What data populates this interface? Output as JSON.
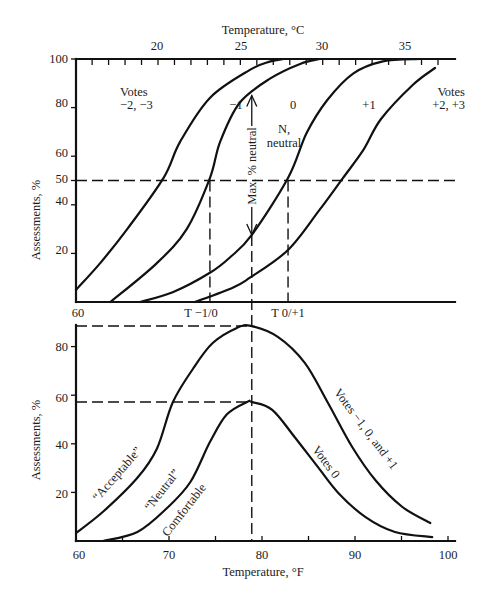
{
  "figure": {
    "top_axis": {
      "title": "Temperature, °C",
      "tick_labels": [
        "20",
        "25",
        "30",
        "35"
      ]
    },
    "bottom_axis": {
      "title": "Temperature, °F",
      "tick_labels": [
        "60",
        "70",
        "80",
        "90",
        "100"
      ]
    },
    "upper_panel": {
      "ylabel": "Assessments, %",
      "ytick_labels": [
        "100",
        "80",
        "60",
        "50",
        "40",
        "20"
      ],
      "x_start_label": "60",
      "t_minus1_0_label": "T −1/0",
      "t_0_plus1_label": "T 0/+1",
      "zone_labels": {
        "votes_neg": [
          "Votes",
          "−2, −3"
        ],
        "minus1": "−1",
        "zero": "0",
        "plus1": "+1",
        "votes_pos": [
          "Votes",
          "+2, +3"
        ],
        "neutral": [
          "N,",
          "neutral"
        ]
      },
      "max_label": "Max. % neutral"
    },
    "lower_panel": {
      "ylabel": "Assessments, %",
      "ytick_labels": [
        "80",
        "60",
        "40",
        "20"
      ],
      "curve_labels": {
        "acceptable": "“Acceptable”",
        "neutral": "“Neutral”",
        "comfortable": "Comfortable",
        "votes0": "Votes 0",
        "votes_m1_0_p1": "Votes −1, 0, and +1"
      }
    },
    "colors": {
      "ink": "#111111",
      "background": "#ffffff"
    }
  },
  "chart_data": [
    {
      "type": "line",
      "panel": "upper",
      "title": "",
      "xlabel": "Temperature, °F",
      "x2label": "Temperature, °C",
      "ylabel": "Assessments, %",
      "xlim": [
        60,
        101
      ],
      "x2_ticks": [
        20,
        25,
        30,
        35
      ],
      "x2_minor_tick_range": [
        16,
        37
      ],
      "ylim": [
        0,
        100
      ],
      "yticks": [
        20,
        40,
        50,
        60,
        80,
        100
      ],
      "grid": false,
      "legend": "none (inline zone labels)",
      "zones": [
        "Votes −2, −3",
        "−1",
        "0",
        "+1",
        "Votes +2, +3"
      ],
      "series": [
        {
          "name": "Boundary: votes −2,−3 | −1",
          "points": [
            [
              60,
              5
            ],
            [
              62.6,
              16
            ],
            [
              65.5,
              30
            ],
            [
              69.4,
              51
            ],
            [
              71.2,
              66
            ],
            [
              74.4,
              84
            ],
            [
              78.7,
              95.5
            ],
            [
              80.9,
              99
            ],
            [
              82.3,
              100
            ]
          ]
        },
        {
          "name": "Boundary: votes −1 | 0",
          "points": [
            [
              63.7,
              0
            ],
            [
              68.7,
              16
            ],
            [
              71.9,
              30
            ],
            [
              74.4,
              51
            ],
            [
              75.5,
              66
            ],
            [
              77.6,
              82
            ],
            [
              80.9,
              92
            ],
            [
              84.1,
              98
            ],
            [
              86.2,
              100
            ]
          ]
        },
        {
          "name": "Boundary: votes 0 | +1",
          "points": [
            [
              66.9,
              0
            ],
            [
              70.4,
              4
            ],
            [
              74.4,
              12
            ],
            [
              76.6,
              18.5
            ],
            [
              78.9,
              27.6
            ],
            [
              82.8,
              51
            ],
            [
              84.8,
              69.5
            ],
            [
              87,
              83
            ],
            [
              89.8,
              94
            ],
            [
              93,
              99
            ],
            [
              97,
              100
            ]
          ]
        },
        {
          "name": "Boundary: votes +1 | +2,+3",
          "points": [
            [
              72.8,
              0
            ],
            [
              76.9,
              6
            ],
            [
              78.7,
              10
            ],
            [
              82.8,
              21.4
            ],
            [
              86.2,
              38
            ],
            [
              88.7,
              51
            ],
            [
              90.9,
              62.6
            ],
            [
              92.8,
              75.3
            ],
            [
              96.2,
              89.3
            ],
            [
              98.6,
              96.3
            ]
          ]
        }
      ],
      "reference_lines": [
        {
          "orientation": "h",
          "value": 50
        },
        {
          "orientation": "v",
          "value": 74.4,
          "label": "T −1/0"
        },
        {
          "orientation": "v",
          "value": 82.8,
          "label": "T 0/+1"
        }
      ],
      "annotations": [
        {
          "type": "double-arrow",
          "text": "Max. % neutral",
          "x": 78.9,
          "y_from": 85,
          "y_to": 27.6
        },
        {
          "type": "text",
          "text": "N, neutral",
          "zone": "0"
        }
      ]
    },
    {
      "type": "line",
      "panel": "lower",
      "title": "",
      "xlabel": "Temperature, °F",
      "ylabel": "Assessments, %",
      "xlim": [
        60,
        101
      ],
      "xticks": [
        60,
        70,
        80,
        90,
        100
      ],
      "x_minor_step": 5,
      "ylim": [
        0,
        89
      ],
      "yticks": [
        20,
        40,
        60,
        80
      ],
      "grid": false,
      "series": [
        {
          "name": "“Acceptable” (Votes −1, 0, and +1)",
          "points": [
            [
              60,
              3.3
            ],
            [
              62.9,
              12
            ],
            [
              66.6,
              26
            ],
            [
              68.7,
              38
            ],
            [
              70.4,
              57
            ],
            [
              72.6,
              71
            ],
            [
              74.7,
              81.5
            ],
            [
              77.3,
              87.7
            ],
            [
              78.8,
              88.5
            ],
            [
              81.7,
              84
            ],
            [
              84.6,
              73.3
            ],
            [
              87.1,
              56.8
            ],
            [
              89.7,
              38.7
            ],
            [
              92.2,
              25
            ],
            [
              95.1,
              14
            ],
            [
              98.1,
              7.4
            ]
          ]
        },
        {
          "name": "“Neutral” Comfortable (Votes 0)",
          "points": [
            [
              62.9,
              0
            ],
            [
              66.6,
              3.7
            ],
            [
              69.8,
              13.6
            ],
            [
              72.3,
              24.3
            ],
            [
              74.4,
              40.7
            ],
            [
              76.2,
              52
            ],
            [
              78.4,
              57.2
            ],
            [
              78.9,
              57.2
            ],
            [
              81.1,
              54
            ],
            [
              83.5,
              42.8
            ],
            [
              86,
              30.5
            ],
            [
              88.2,
              19.8
            ],
            [
              91.1,
              9.9
            ],
            [
              94.3,
              3.7
            ],
            [
              98.3,
              1.6
            ]
          ]
        }
      ],
      "reference_lines": [
        {
          "orientation": "h",
          "value": 88.5,
          "x_to": 78.9
        },
        {
          "orientation": "h",
          "value": 57.2,
          "x_to": 78.9
        },
        {
          "orientation": "v",
          "value": 78.9,
          "spans_both_panels": true,
          "from_upper_pct": 27.6
        }
      ]
    }
  ]
}
